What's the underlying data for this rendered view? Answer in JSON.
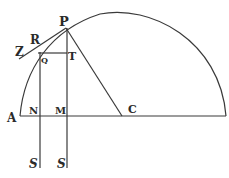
{
  "diagram": {
    "type": "geometric-construction",
    "stroke_color": "#3a3a3a",
    "background": "#ffffff",
    "labels": {
      "P": "P",
      "R": "R",
      "Z": "Z",
      "Q": "Q",
      "T": "T",
      "A": "A",
      "N": "N",
      "M": "M",
      "C": "C",
      "S1": "S",
      "S2": "S"
    },
    "points": {
      "A": [
        20,
        116
      ],
      "C": [
        122,
        116
      ],
      "P": [
        66,
        28
      ],
      "Q": [
        40,
        53
      ],
      "T": [
        67,
        53
      ],
      "R": [
        34,
        43
      ],
      "Z": [
        19,
        58
      ],
      "N": [
        40,
        116
      ],
      "M": [
        67,
        116
      ]
    }
  }
}
